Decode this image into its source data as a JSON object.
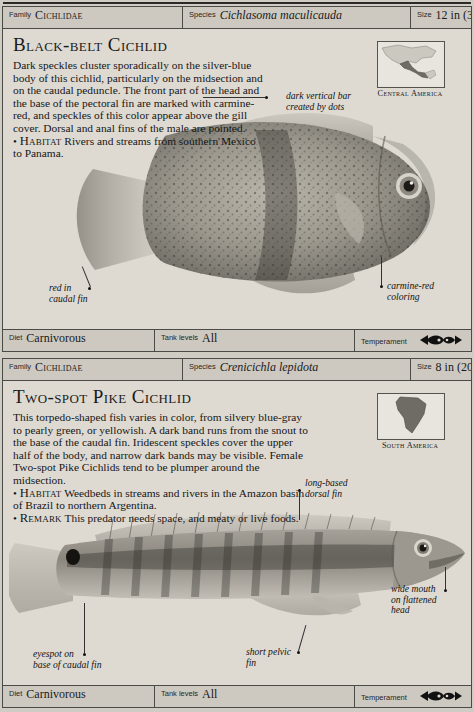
{
  "page": {
    "background": "#cfccc4",
    "card_background": "#ddd9d1"
  },
  "entries": [
    {
      "header": {
        "family_label": "Family",
        "family_value": "Cichlidae",
        "species_label": "Species",
        "species_value": "Cichlasoma maculicauda",
        "size_label": "Size",
        "size_value": "12 in (30 cm)"
      },
      "title": "Black-belt Cichlid",
      "description": "Dark speckles cluster sporadically on the silver-blue body of this cichlid, particularly on the midsection and on the caudal peduncle. The front part of the head and the base of the pectoral fin are marked with carmine-red, and speckles of this color appear above the gill cover. Dorsal and anal fins of the male are pointed.",
      "facts": [
        {
          "keyword": "Habitat",
          "text": "Rivers and streams from southern Mexico to Panama."
        }
      ],
      "map": {
        "caption": "Central America",
        "icon": "north-central-america-map"
      },
      "annotations": [
        {
          "name": "dark-vertical-bar",
          "text": "dark vertical bar\ncreated by dots"
        },
        {
          "name": "red-in-caudal-fin",
          "text": "red in\ncaudal fin"
        },
        {
          "name": "carmine-red-coloring",
          "text": "carmine-red\ncoloring"
        }
      ],
      "footer": {
        "diet_label": "Diet",
        "diet_value": "Carnivorous",
        "tank_label": "Tank levels",
        "tank_value": "All",
        "temperament_label": "Temperament",
        "temperament_icon": "two-fish-aggressive-icon"
      }
    },
    {
      "header": {
        "family_label": "Family",
        "family_value": "Cichlidae",
        "species_label": "Species",
        "species_value": "Crenicichla lepidota",
        "size_label": "Size",
        "size_value": "8 in (20 cm)"
      },
      "title": "Two-spot Pike Cichlid",
      "description": "This torpedo-shaped fish varies in color, from silvery blue-gray to pearly green, or yellowish. A dark band runs from the snout to the base of the caudal fin. Iridescent speckles cover the upper half of the body, and narrow dark bands may be visible. Female Two-spot Pike Cichlids tend to be plumper around the midsection.",
      "facts": [
        {
          "keyword": "Habitat",
          "text": "Weedbeds in streams and rivers in the Amazon basin of Brazil to northern Argentina."
        },
        {
          "keyword": "Remark",
          "text": "This predator needs space, and meaty or live foods."
        }
      ],
      "map": {
        "caption": "South America",
        "icon": "south-america-map"
      },
      "annotations": [
        {
          "name": "long-based-dorsal-fin",
          "text": "long-based\ndorsal fin"
        },
        {
          "name": "wide-mouth-on-flattened-head",
          "text": "wide mouth\non flattened\nhead"
        },
        {
          "name": "eyespot-on-base-of-caudal-fin",
          "text": "eyespot on\nbase of caudal fin"
        },
        {
          "name": "short-pelvic-fin",
          "text": "short pelvic\nfin"
        }
      ],
      "footer": {
        "diet_label": "Diet",
        "diet_value": "Carnivorous",
        "tank_label": "Tank levels",
        "tank_value": "All",
        "temperament_label": "Temperament",
        "temperament_icon": "two-fish-aggressive-icon"
      }
    }
  ]
}
